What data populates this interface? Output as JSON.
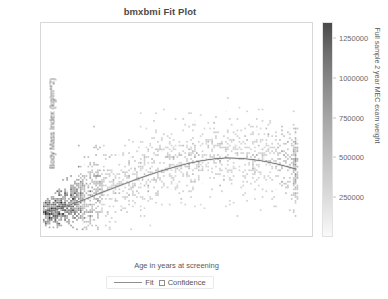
{
  "chart_data": {
    "type": "scatter",
    "title": "bmxbmi Fit Plot",
    "xlabel": "Age in years at screening",
    "ylabel": "Body Mass Index (kg/m**2)",
    "xlim": [
      0,
      85
    ],
    "ylim": [
      10,
      67
    ],
    "xticks": [
      20,
      40,
      60,
      80
    ],
    "xtick_labels": [
      "20",
      "40",
      "60",
      "80"
    ],
    "yticks": [
      20,
      30,
      40,
      50,
      60
    ],
    "ytick_labels": [
      "20",
      "30",
      "40",
      "50",
      "60"
    ],
    "grid": false,
    "legend_position": "bottom-center",
    "legend": [
      {
        "label": "Fit",
        "marker": "line",
        "color": "#8f8f8f"
      },
      {
        "label": "Confidence",
        "marker": "square",
        "color": "#909090"
      }
    ],
    "colorbar": {
      "title": "Full sample 2 year MEC exam weight",
      "ticks": [
        250000,
        500000,
        750000,
        1000000,
        1250000
      ],
      "tick_labels": [
        "250000",
        "500000",
        "750000",
        "1000000",
        "1250000"
      ],
      "vmin": 0,
      "vmax": 1350000,
      "colormap": "grayscale-reversed",
      "low_color": "#fafafa",
      "high_color": "#4a4a4a"
    },
    "fit_curve": {
      "name": "Fit",
      "description": "Quadratic fit of BMI on age, peaking near age 55",
      "x": [
        2,
        6,
        10,
        14,
        18,
        22,
        26,
        30,
        34,
        38,
        42,
        46,
        50,
        54,
        58,
        62,
        66,
        70,
        74,
        78,
        80
      ],
      "y": [
        16.3,
        17.4,
        18.6,
        19.9,
        21.3,
        22.6,
        23.9,
        25.2,
        26.4,
        27.5,
        28.5,
        29.4,
        30.1,
        30.6,
        30.9,
        30.8,
        30.5,
        30.0,
        29.3,
        28.4,
        27.9
      ]
    },
    "scatter_summary": {
      "n_bins_x": 42,
      "n_bins_y": 34,
      "dense_region": "ages 2-12 at BMI 14-20, and ages 20-70 at BMI 22-34",
      "y_spread_max": 67,
      "y_spread_min": 12
    }
  }
}
